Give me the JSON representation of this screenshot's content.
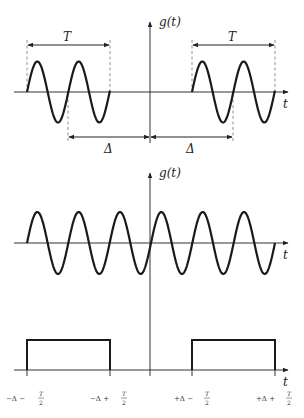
{
  "diagram": {
    "title": "",
    "panels": [
      {
        "id": "top",
        "y_label": "g(t)",
        "x_label": "t",
        "description": "Two windowed sinusoid bursts of duration T centered at -Δ and +Δ",
        "annotations": {
          "left_width_label": "T",
          "right_width_label": "T",
          "left_offset_label": "Δ",
          "right_offset_label": "Δ"
        }
      },
      {
        "id": "middle",
        "y_label": "g(t)",
        "x_label": "t",
        "description": "Continuous sinusoid"
      },
      {
        "id": "bottom",
        "x_label": "t",
        "description": "Two rectangular windows",
        "tick_labels": [
          {
            "main": "−Δ − ",
            "num": "T",
            "den": "2"
          },
          {
            "main": "−Δ + ",
            "num": "T",
            "den": "2"
          },
          {
            "main": "+Δ − ",
            "num": "T",
            "den": "2"
          },
          {
            "main": "+Δ + ",
            "num": "T",
            "den": "2"
          }
        ]
      }
    ]
  },
  "colors": {
    "curve": "#1a1a1a",
    "axis": "#333333",
    "dashed": "#777777"
  }
}
